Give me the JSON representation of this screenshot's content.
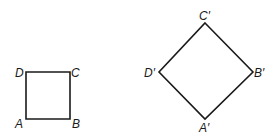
{
  "figure": {
    "original": {
      "name": "square ABCD",
      "vertices": [
        "A",
        "B",
        "C",
        "D"
      ]
    },
    "image": {
      "name": "square A'B'C'D'",
      "vertices": [
        "A'",
        "B'",
        "C'",
        "D'"
      ]
    },
    "labels": {
      "A": "A",
      "B": "B",
      "C": "C",
      "D": "D",
      "A_prime": "A′",
      "B_prime": "B′",
      "C_prime": "C′",
      "D_prime": "D′"
    },
    "line_color": "#1a1a1a"
  }
}
